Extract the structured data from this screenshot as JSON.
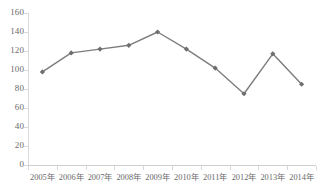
{
  "chart_data": {
    "type": "line",
    "title": "",
    "xlabel": "",
    "ylabel": "",
    "categories": [
      "2005年",
      "2006年",
      "2007年",
      "2008年",
      "2009年",
      "2010年",
      "2011年",
      "2012年",
      "2013年",
      "2014年"
    ],
    "series": [
      {
        "name": "",
        "values": [
          98,
          118,
          122,
          126,
          140,
          122,
          102,
          75,
          117,
          85
        ]
      }
    ],
    "ylim": [
      0,
      160
    ],
    "ytick_step": 20,
    "yticks": [
      0,
      20,
      40,
      60,
      80,
      100,
      120,
      140,
      160
    ],
    "ytick_labels": [
      "0",
      "20",
      "40",
      "60",
      "80",
      "100",
      "120",
      "140",
      "160"
    ],
    "grid": false,
    "legend": false,
    "legend_position": "none",
    "marker": "diamond",
    "colors": {
      "line": "#7d7d7d",
      "marker": "#6e6e6e",
      "axis": "#d9d9d9",
      "text": "#6b6b6b",
      "background": "#ffffff"
    }
  }
}
